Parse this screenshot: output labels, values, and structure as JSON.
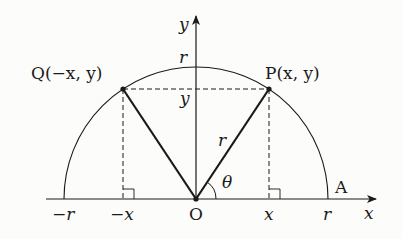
{
  "diagram": {
    "type": "unit-circle-symmetry",
    "colors": {
      "ink": "#1a1a1a",
      "background": "#fcfcfb"
    },
    "axes": {
      "x_label": "x",
      "y_label": "y"
    },
    "points": {
      "P": {
        "label": "P(x, y)"
      },
      "Q": {
        "label": "Q(−x, y)"
      },
      "O": {
        "label": "O"
      },
      "A": {
        "label": "A"
      }
    },
    "tick_labels": {
      "neg_r": "−r",
      "neg_x": "−x",
      "x": "x",
      "r": "r",
      "y_top_r": "r",
      "y_level": "y"
    },
    "segment_labels": {
      "OP_length": "r",
      "angle": "θ"
    }
  }
}
